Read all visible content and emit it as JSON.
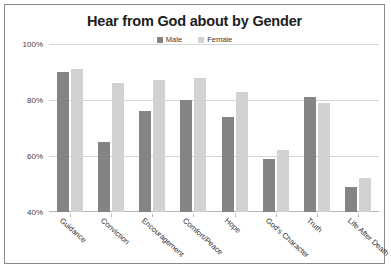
{
  "chart_data": {
    "type": "bar",
    "title": "Hear from God about by Gender",
    "xlabel": "",
    "ylabel": "",
    "ylim": [
      40,
      100
    ],
    "ytick_labels": [
      "100%",
      "80%",
      "60%",
      "40%"
    ],
    "ytick_values": [
      100,
      80,
      60,
      40
    ],
    "grid": true,
    "legend_position": "top-center",
    "categories": [
      "Guidance",
      "Conviction",
      "Encouragement",
      "Comfort/Peace",
      "Hope",
      "God's Character",
      "Truth",
      "Life After Death"
    ],
    "series": [
      {
        "name": "Male",
        "color": "#848484",
        "values": [
          90,
          65,
          76,
          80,
          74,
          59,
          81,
          49
        ]
      },
      {
        "name": "Female",
        "color": "#d2d2d2",
        "values": [
          91,
          86,
          87,
          88,
          83,
          62,
          79,
          52
        ]
      }
    ]
  }
}
